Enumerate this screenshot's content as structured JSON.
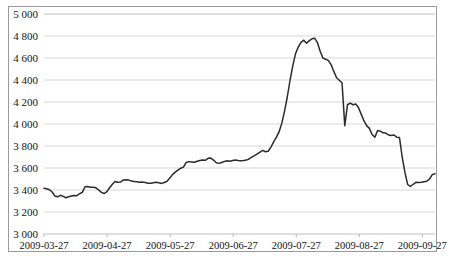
{
  "chart_data": {
    "type": "line",
    "title": "",
    "subtitle": "",
    "xlabel": "",
    "ylabel": "",
    "grid": true,
    "legend": null,
    "legend_position": "none",
    "ylim": [
      3000,
      5000
    ],
    "ytick_step": 200,
    "ytick_labels": [
      "5 000",
      "4 800",
      "4 600",
      "4 400",
      "4 200",
      "4 000",
      "3 800",
      "3 600",
      "3 400",
      "3 200",
      "3 000"
    ],
    "ytick_values": [
      5000,
      4800,
      4600,
      4400,
      4200,
      4000,
      3800,
      3600,
      3400,
      3200,
      3000
    ],
    "xtick_labels": [
      "2009-03-27",
      "2009-04-27",
      "2009-05-27",
      "2009-06-27",
      "2009-07-27",
      "2009-09-27",
      "2009-09-27"
    ],
    "xtick_labels_actual": [
      "2009-03-27",
      "2009-04-27",
      "2009-05-27",
      "2009-06-27",
      "2009-07-27",
      "2009-08-27",
      "2009-09-27"
    ],
    "xtick_positions_frac": [
      0.0,
      0.1613,
      0.3226,
      0.4839,
      0.6452,
      0.8065,
      0.9677
    ],
    "x_index_range": [
      0,
      130
    ],
    "series": [
      {
        "name": "price",
        "color": "#2b2b2b",
        "values": [
          3415,
          3412,
          3402,
          3382,
          3345,
          3338,
          3352,
          3342,
          3330,
          3338,
          3345,
          3350,
          3348,
          3366,
          3378,
          3430,
          3432,
          3425,
          3424,
          3420,
          3400,
          3378,
          3368,
          3385,
          3420,
          3452,
          3478,
          3470,
          3472,
          3492,
          3494,
          3490,
          3482,
          3478,
          3475,
          3470,
          3472,
          3468,
          3462,
          3462,
          3466,
          3470,
          3466,
          3460,
          3468,
          3480,
          3508,
          3540,
          3562,
          3580,
          3598,
          3608,
          3650,
          3658,
          3655,
          3652,
          3662,
          3668,
          3672,
          3670,
          3688,
          3690,
          3672,
          3648,
          3642,
          3650,
          3660,
          3665,
          3662,
          3668,
          3672,
          3668,
          3665,
          3668,
          3672,
          3682,
          3700,
          3712,
          3728,
          3745,
          3760,
          3748,
          3752,
          3790,
          3838,
          3880,
          3930,
          4010,
          4120,
          4250,
          4400,
          4530,
          4640,
          4700,
          4742,
          4762,
          4735,
          4755,
          4775,
          4780,
          4740,
          4662,
          4600,
          4588,
          4578,
          4540,
          4478,
          4420,
          4398,
          4375,
          3985,
          4175,
          4190,
          4175,
          4182,
          4150,
          4090,
          4030,
          3985,
          3960,
          3905,
          3880,
          3940,
          3935,
          3920,
          3918,
          3900,
          3895,
          3900,
          3880,
          3878,
          3700,
          3560,
          3450,
          3432,
          3452,
          3470,
          3468,
          3470,
          3475,
          3480,
          3500,
          3540,
          3548
        ]
      }
    ]
  },
  "axes": {
    "plot_left_px": 44,
    "plot_right_px": 435,
    "plot_top_px": 14,
    "plot_bottom_px": 234
  }
}
